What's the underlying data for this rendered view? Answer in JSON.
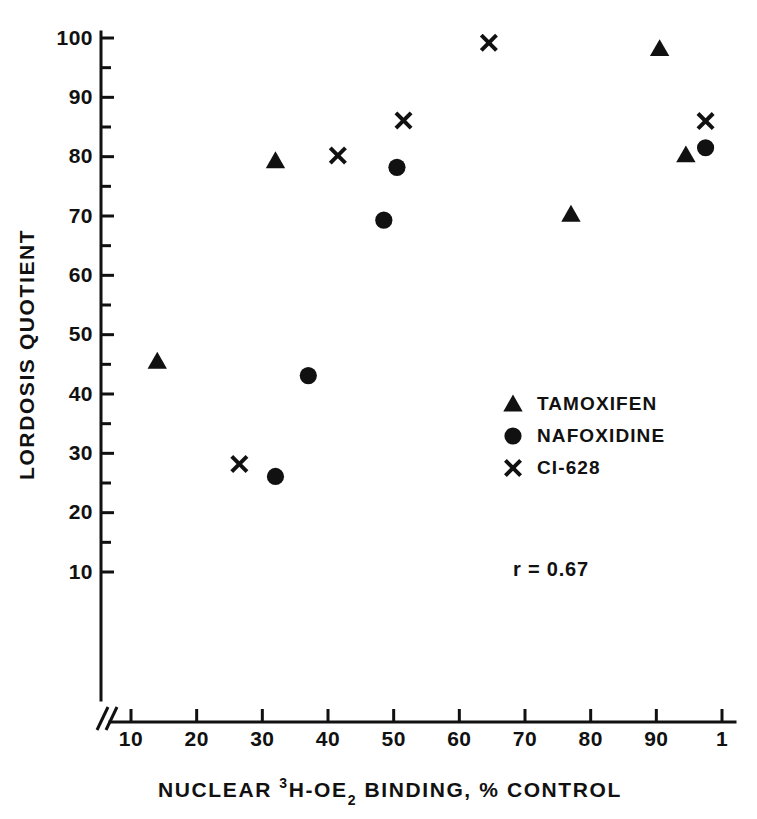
{
  "chart_data": {
    "type": "scatter",
    "title": "",
    "xlabel": "NUCLEAR 3H-OE2 BINDING, % CONTROL",
    "xlabel_parts": {
      "before": "NUCLEAR ",
      "sup": "3",
      "mid": "H-OE",
      "sub": "2",
      "after": " BINDING, % CONTROL"
    },
    "ylabel": "LORDOSIS QUOTIENT",
    "xlim": [
      5,
      103
    ],
    "ylim": [
      3,
      103
    ],
    "xticks": [
      10,
      20,
      30,
      40,
      50,
      60,
      70,
      80,
      90,
      100
    ],
    "xtick_labels": [
      "10",
      "20",
      "30",
      "40",
      "50",
      "60",
      "70",
      "80",
      "90",
      "1"
    ],
    "yticks": [
      10,
      20,
      30,
      40,
      50,
      60,
      70,
      80,
      90,
      100
    ],
    "ytick_labels": [
      "10",
      "20",
      "30",
      "40",
      "50",
      "60",
      "70",
      "80",
      "90",
      "100"
    ],
    "grid": false,
    "axis_break": true,
    "legend_position": "center-right",
    "annotations": [
      {
        "text": "r = 0.67",
        "x": 63,
        "y": 21
      }
    ],
    "series": [
      {
        "name": "TAMOXIFEN",
        "marker": "triangle",
        "color": "#111111",
        "points": [
          {
            "x": 14,
            "y": 45.5
          },
          {
            "x": 32,
            "y": 79.3
          },
          {
            "x": 77,
            "y": 70.3
          },
          {
            "x": 90.5,
            "y": 98.2
          },
          {
            "x": 94.5,
            "y": 80.3
          }
        ]
      },
      {
        "name": "NAFOXIDINE",
        "marker": "circle",
        "color": "#111111",
        "points": [
          {
            "x": 32,
            "y": 26.1
          },
          {
            "x": 37,
            "y": 43.1
          },
          {
            "x": 48.5,
            "y": 69.3
          },
          {
            "x": 50.5,
            "y": 78.2
          },
          {
            "x": 97.5,
            "y": 81.5
          }
        ]
      },
      {
        "name": "CI-628",
        "marker": "x",
        "color": "#111111",
        "points": [
          {
            "x": 26.5,
            "y": 28.2
          },
          {
            "x": 41.5,
            "y": 80.2
          },
          {
            "x": 51.5,
            "y": 86.1
          },
          {
            "x": 64.5,
            "y": 99.2
          },
          {
            "x": 97.5,
            "y": 86.0
          }
        ]
      }
    ]
  },
  "legend": {
    "items": [
      {
        "label": "TAMOXIFEN",
        "marker": "triangle"
      },
      {
        "label": "NAFOXIDINE",
        "marker": "circle"
      },
      {
        "label": "CI-628",
        "marker": "x"
      }
    ]
  },
  "stats": {
    "correlation_label": "r = 0.67"
  },
  "colors": {
    "ink": "#111111",
    "background": "#ffffff"
  }
}
